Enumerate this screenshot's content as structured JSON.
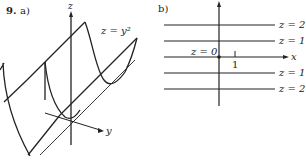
{
  "figure": {
    "problem_number": "9.",
    "part_a": {
      "label": "a)",
      "axis_z": "z",
      "axis_y": "y",
      "surface_equation": "z = y²"
    },
    "part_b": {
      "label": "b)",
      "axis_x": "x",
      "origin_label": "z = 0",
      "tick_label": "1",
      "level_curves": [
        {
          "label": "z = 2",
          "y_value": 1.414
        },
        {
          "label": "z = 1",
          "y_value": 1
        },
        {
          "label": "z = 1",
          "y_value": -1
        },
        {
          "label": "z = 2",
          "y_value": -1.414
        }
      ]
    }
  }
}
